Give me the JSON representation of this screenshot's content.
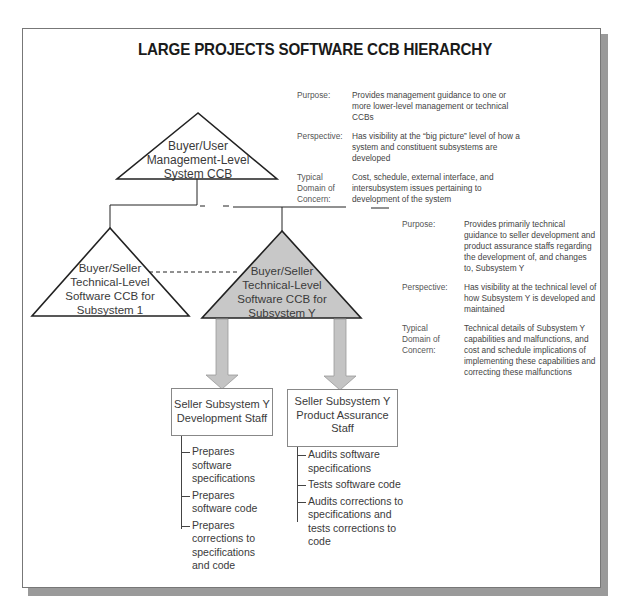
{
  "title": "LARGE PROJECTS SOFTWARE CCB HIERARCHY",
  "colors": {
    "line": "#222222",
    "subsystem_y_fill": "#c8c8c8",
    "arrow_fill": "#c4c4c4",
    "frame_shadow": "#9a9a9a"
  },
  "ccbs": {
    "management": {
      "lines": [
        "Buyer/User",
        "Management-Level",
        "System CCB"
      ]
    },
    "subsystem_1": {
      "lines": [
        "Buyer/Seller",
        "Technical-Level",
        "Software CCB for",
        "Subsystem 1"
      ]
    },
    "subsystem_y": {
      "lines": [
        "Buyer/Seller",
        "Technical-Level",
        "Software CCB for",
        "Subsystem Y"
      ]
    }
  },
  "management_info": {
    "purpose_label": "Purpose:",
    "purpose": "Provides management guidance to one or more lower-level management or technical CCBs",
    "perspective_label": "Perspective:",
    "perspective": "Has visibility at the “big picture” level of how a system and constituent subsystems are developed",
    "domain_label": "Typical Domain of Concern:",
    "domain": "Cost, schedule, external interface, and intersubsystem issues pertaining to development of the system"
  },
  "technical_info": {
    "purpose_label": "Purpose:",
    "purpose": "Provides primarily technical guidance to seller development and product assurance staffs regarding the development of, and changes to, Subsystem Y",
    "perspective_label": "Perspective:",
    "perspective": "Has visibility at the technical level of how Subsystem Y is developed and maintained",
    "domain_label": "Typical Domain of Concern:",
    "domain": "Technical details of Subsystem Y capabilities and malfunctions, and cost and schedule implications of implementing these capabilities and correcting these malfunctions"
  },
  "staff": {
    "development": {
      "lines": [
        "Seller Subsystem Y",
        "Development Staff"
      ],
      "tasks": [
        "Prepares software specifications",
        "Prepares software code",
        "Prepares corrections to specifications and code"
      ]
    },
    "product_assurance": {
      "lines": [
        "Seller Subsystem Y",
        "Product Assurance",
        "Staff"
      ],
      "tasks": [
        "Audits software specifications",
        "Tests software code",
        "Audits corrections to specifications and tests corrections to code"
      ]
    }
  }
}
